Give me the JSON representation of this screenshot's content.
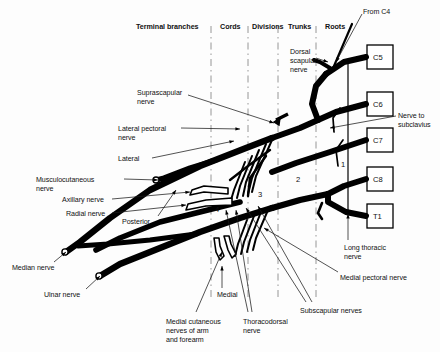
{
  "figure": {
    "ink_color": "#000000",
    "background": "#fdfdfd",
    "divider_color": "#8a8a8a"
  },
  "column_headers": [
    {
      "label": "Terminal branches",
      "x": 136,
      "y": 22
    },
    {
      "label": "Cords",
      "x": 220,
      "y": 22
    },
    {
      "label": "Divisions",
      "x": 252,
      "y": 22
    },
    {
      "label": "Trunks",
      "x": 288,
      "y": 22
    },
    {
      "label": "Roots",
      "x": 325,
      "y": 22
    }
  ],
  "dividers": [
    {
      "name": "divider-terminal-cords",
      "x": 211,
      "y1": 26,
      "y2": 300
    },
    {
      "name": "divider-cords-divisions",
      "x": 248,
      "y1": 26,
      "y2": 300
    },
    {
      "name": "divider-divisions-trunks",
      "x": 278,
      "y1": 26,
      "y2": 300
    },
    {
      "name": "divider-trunks-roots",
      "x": 316,
      "y1": 26,
      "y2": 300
    }
  ],
  "root_boxes": [
    {
      "label": "C5",
      "x": 367,
      "y": 45,
      "w": 26,
      "h": 24
    },
    {
      "label": "C6",
      "x": 367,
      "y": 92,
      "w": 26,
      "h": 24
    },
    {
      "label": "C7",
      "x": 367,
      "y": 128,
      "w": 26,
      "h": 24
    },
    {
      "label": "C8",
      "x": 367,
      "y": 167,
      "w": 26,
      "h": 24
    },
    {
      "label": "T1",
      "x": 367,
      "y": 204,
      "w": 26,
      "h": 24
    }
  ],
  "zone_numbers": [
    {
      "label": "1",
      "x": 341,
      "y": 160
    },
    {
      "label": "2",
      "x": 296,
      "y": 175
    },
    {
      "label": "3",
      "x": 258,
      "y": 190
    },
    {
      "label": "4",
      "x": 215,
      "y": 205
    }
  ],
  "labels": [
    {
      "name": "from-c4-label",
      "text": "From C4",
      "x": 363,
      "y": 8,
      "align": "left"
    },
    {
      "name": "dorsal-scapular-label",
      "text": "Dorsal\nscapular\nnerve",
      "x": 290,
      "y": 48,
      "align": "left"
    },
    {
      "name": "suprascapular-label",
      "text": "Suprascapular\nnerve",
      "x": 137,
      "y": 89,
      "align": "left"
    },
    {
      "name": "nerve-to-subclavius-label",
      "text": "Nerve to\nsubclavius",
      "x": 398,
      "y": 112,
      "align": "left"
    },
    {
      "name": "lateral-pectoral-label",
      "text": "Lateral pectoral\nnerve",
      "x": 118,
      "y": 125,
      "align": "left"
    },
    {
      "name": "lateral-cord-label",
      "text": "Lateral",
      "x": 118,
      "y": 155,
      "align": "left"
    },
    {
      "name": "musculocutaneous-label",
      "text": "Musculocutaneous\nnerve",
      "x": 36,
      "y": 176,
      "align": "left"
    },
    {
      "name": "axillary-nerve-label",
      "text": "Axillary nerve",
      "x": 62,
      "y": 196,
      "align": "left"
    },
    {
      "name": "radial-nerve-label",
      "text": "Radial nerve",
      "x": 66,
      "y": 210,
      "align": "left"
    },
    {
      "name": "posterior-cord-label",
      "text": "Posterior",
      "x": 122,
      "y": 218,
      "align": "left"
    },
    {
      "name": "long-thoracic-label",
      "text": "Long thoracic\nnerve",
      "x": 344,
      "y": 244,
      "align": "left"
    },
    {
      "name": "medial-pectoral-label",
      "text": "Medial pectoral nerve",
      "x": 340,
      "y": 274,
      "align": "left"
    },
    {
      "name": "median-nerve-label",
      "text": "Median nerve",
      "x": 12,
      "y": 264,
      "align": "left"
    },
    {
      "name": "ulnar-nerve-label",
      "text": "Ulnar nerve",
      "x": 44,
      "y": 291,
      "align": "left"
    },
    {
      "name": "medial-cord-label",
      "text": "Medial",
      "x": 217,
      "y": 291,
      "align": "left"
    },
    {
      "name": "subscapular-label",
      "text": "Subscapular nerves",
      "x": 300,
      "y": 307,
      "align": "left"
    },
    {
      "name": "thoracodorsal-label",
      "text": "Thoracodorsal\nnerve",
      "x": 243,
      "y": 318,
      "align": "left"
    },
    {
      "name": "medial-cutaneous-label",
      "text": "Medial cutaneous\nnerves of arm\nand forearm",
      "x": 166,
      "y": 318,
      "align": "left"
    }
  ],
  "leaders": [
    {
      "name": "leader-from-c4",
      "x1": 362,
      "y1": 14,
      "x2": 336,
      "y2": 62
    },
    {
      "name": "leader-suprascapular",
      "x1": 188,
      "y1": 95,
      "x2": 274,
      "y2": 123
    },
    {
      "name": "leader-lateral-pectoral",
      "x1": 181,
      "y1": 128,
      "x2": 240,
      "y2": 129
    },
    {
      "name": "leader-lateral-cord",
      "x1": 152,
      "y1": 158,
      "x2": 234,
      "y2": 141
    },
    {
      "name": "leader-musculocutaneous",
      "x1": 124,
      "y1": 179,
      "x2": 158,
      "y2": 180
    },
    {
      "name": "leader-axillary",
      "x1": 112,
      "y1": 199,
      "x2": 190,
      "y2": 192
    },
    {
      "name": "leader-radial",
      "x1": 112,
      "y1": 213,
      "x2": 186,
      "y2": 205
    },
    {
      "name": "leader-posterior",
      "x1": 158,
      "y1": 216,
      "x2": 176,
      "y2": 190
    },
    {
      "name": "leader-subclavius",
      "x1": 396,
      "y1": 116,
      "x2": 330,
      "y2": 128
    },
    {
      "name": "leader-dorsal-scapular",
      "x1": 316,
      "y1": 58,
      "x2": 328,
      "y2": 62
    },
    {
      "name": "leader-long-thoracic",
      "x1": 348,
      "y1": 240,
      "x2": 348,
      "y2": 214
    },
    {
      "name": "leader-medial-pectoral",
      "x1": 338,
      "y1": 272,
      "x2": 264,
      "y2": 228
    },
    {
      "name": "leader-median",
      "x1": 54,
      "y1": 262,
      "x2": 66,
      "y2": 252
    },
    {
      "name": "leader-ulnar",
      "x1": 86,
      "y1": 289,
      "x2": 100,
      "y2": 276
    },
    {
      "name": "leader-medial-cord",
      "x1": 222,
      "y1": 288,
      "x2": 222,
      "y2": 266
    },
    {
      "name": "leader-medial-cutaneous",
      "x1": 196,
      "y1": 312,
      "x2": 222,
      "y2": 252
    },
    {
      "name": "leader-thoracodorsal-a",
      "x1": 248,
      "y1": 312,
      "x2": 226,
      "y2": 210
    },
    {
      "name": "leader-thoracodorsal-b",
      "x1": 252,
      "y1": 312,
      "x2": 236,
      "y2": 210
    },
    {
      "name": "leader-subscapular-a",
      "x1": 306,
      "y1": 302,
      "x2": 246,
      "y2": 208
    },
    {
      "name": "leader-subscapular-b",
      "x1": 312,
      "y1": 302,
      "x2": 258,
      "y2": 206
    }
  ]
}
